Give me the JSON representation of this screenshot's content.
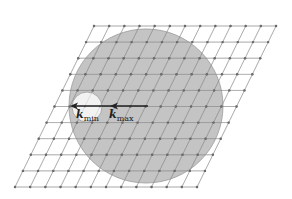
{
  "figure": {
    "type": "reciprocal-lattice-ewald-diagram",
    "lattice": {
      "rows": 11,
      "cols": 13,
      "origin_top_left": [
        94,
        26
      ],
      "col_step": [
        15.17,
        0
      ],
      "row_step": [
        -7.9,
        16.1
      ],
      "line_color": "#8a8a8a",
      "point_color": "#666666"
    },
    "large_circle": {
      "cx": 146,
      "cy": 106,
      "r": 77,
      "fill": "#c4c4c4",
      "stroke": "#9a9a9a"
    },
    "small_circle": {
      "cx": 87,
      "cy": 107,
      "r": 15,
      "fill": "#f2f2f2",
      "stroke": "#9a9a9a"
    },
    "arrow": {
      "x1": 148,
      "y1": 106,
      "x2": 70,
      "y2": 106,
      "mid_head_x": 110,
      "color": "#222222"
    },
    "labels": {
      "kmin": {
        "main": "k",
        "sub": "min"
      },
      "kmax": {
        "main": "k",
        "sub": "max"
      }
    }
  }
}
